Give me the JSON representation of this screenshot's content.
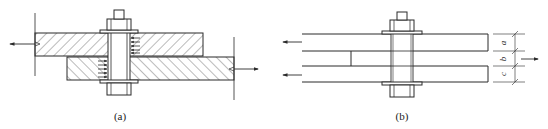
{
  "figure": {
    "panels": [
      {
        "id": "a",
        "caption": "(a)",
        "view": "section",
        "parts": [
          "upper-plate-hatched",
          "lower-plate-hatched",
          "bolt",
          "nut",
          "washers"
        ],
        "load_arrows": [
          "left on upper plate",
          "right on lower plate"
        ],
        "bearing_arrows": "pressure arrows on bolt shank"
      },
      {
        "id": "b",
        "caption": "(b)",
        "view": "side",
        "plates": 3,
        "dimensions": [
          {
            "label": "a"
          },
          {
            "label": "b"
          },
          {
            "label": "c"
          }
        ],
        "load_arrows": [
          "left on top plate",
          "left on bottom plate",
          "right on middle plate"
        ]
      }
    ]
  },
  "colors": {
    "line": "#2a2a2a",
    "hatch": "#555555",
    "background": "#ffffff"
  }
}
